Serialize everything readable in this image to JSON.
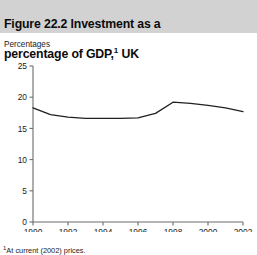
{
  "figure": {
    "title_line1": "Figure 22.2  Investment as a",
    "title_line2": "percentage of GDP,",
    "title_footnote_marker": "1",
    "title_line2_tail": " UK",
    "unit_caption": "Percentages",
    "footnote_marker": "1",
    "footnote_text": "At current (2002) prices."
  },
  "chart_data": {
    "type": "line",
    "subtitle": "",
    "xlabel": "",
    "ylabel": "Percentages",
    "xlim": [
      1990,
      2002
    ],
    "ylim": [
      0,
      25
    ],
    "yticks": [
      0,
      5,
      10,
      15,
      20,
      25
    ],
    "ytick_labels": [
      "0",
      "5",
      "10",
      "15",
      "20",
      "25"
    ],
    "xticks": [
      1990,
      1992,
      1994,
      1996,
      1998,
      2000,
      2002
    ],
    "xtick_labels": [
      "1990",
      "1992",
      "1994",
      "1996",
      "1998",
      "2000",
      "2002"
    ],
    "grid": false,
    "legend": false,
    "line_color": "#231f20",
    "line_width": 1.3,
    "x": [
      1990,
      1991,
      1992,
      1993,
      1994,
      1995,
      1996,
      1997,
      1998,
      1999,
      2000,
      2001,
      2002
    ],
    "series": [
      {
        "name": "Investment as a percentage of GDP",
        "values": [
          18.3,
          17.2,
          16.8,
          16.6,
          16.6,
          16.6,
          16.7,
          17.4,
          19.2,
          19.0,
          18.7,
          18.3,
          17.7
        ]
      }
    ]
  }
}
